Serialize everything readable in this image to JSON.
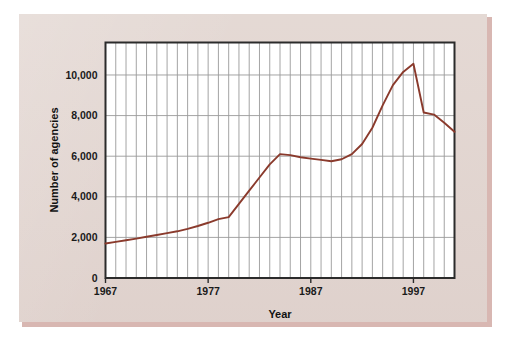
{
  "figure": {
    "background_color": "#e3d7d2",
    "shadow_color": "#d8b7b2",
    "page_color": "#ffffff",
    "plot_background_color": "#ffffff",
    "axis_color": "#2b2b2b",
    "gridline_color": "#9a9a9a",
    "series_color": "#8a3a2c"
  },
  "chart_data": {
    "type": "line",
    "title": "",
    "xlabel": "Year",
    "ylabel": "Number of agencies",
    "xlim": [
      1967,
      2001
    ],
    "ylim": [
      0,
      11600
    ],
    "grid": true,
    "grid_x": "every year",
    "grid_y": "every 2,000",
    "legend": "none",
    "ytick_values": [
      0,
      2000,
      4000,
      6000,
      8000,
      10000
    ],
    "ytick_labels": [
      "0",
      "2,000",
      "4,000",
      "6,000",
      "8,000",
      "10,000"
    ],
    "xtick_values": [
      1967,
      1977,
      1987,
      1997
    ],
    "xtick_labels": [
      "1967",
      "1977",
      "1987",
      "1997"
    ],
    "x": [
      1967,
      1968,
      1969,
      1970,
      1971,
      1972,
      1973,
      1974,
      1975,
      1976,
      1977,
      1978,
      1979,
      1980,
      1981,
      1982,
      1983,
      1984,
      1985,
      1986,
      1987,
      1988,
      1989,
      1990,
      1991,
      1992,
      1993,
      1994,
      1995,
      1996,
      1997,
      1998,
      1999,
      2000,
      2001
    ],
    "values": [
      1700,
      1780,
      1860,
      1940,
      2030,
      2120,
      2210,
      2300,
      2420,
      2560,
      2720,
      2900,
      3000,
      3650,
      4300,
      4950,
      5600,
      6100,
      6050,
      5950,
      5880,
      5820,
      5750,
      5850,
      6100,
      6600,
      7400,
      8500,
      9500,
      10150,
      10550,
      8150,
      8050,
      7650,
      7200
    ],
    "series": [
      {
        "name": "Number of agencies",
        "color": "#8a3a2c",
        "values": [
          1700,
          1780,
          1860,
          1940,
          2030,
          2120,
          2210,
          2300,
          2420,
          2560,
          2720,
          2900,
          3000,
          3650,
          4300,
          4950,
          5600,
          6100,
          6050,
          5950,
          5880,
          5820,
          5750,
          5850,
          6100,
          6600,
          7400,
          8500,
          9500,
          10150,
          10550,
          8150,
          8050,
          7650,
          7200
        ]
      }
    ]
  }
}
